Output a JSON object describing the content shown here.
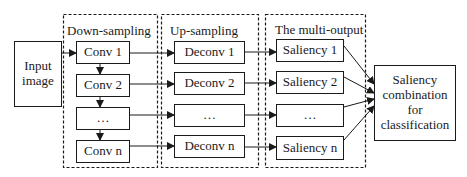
{
  "diagram": {
    "input": {
      "label_lines": [
        "Input",
        "image"
      ]
    },
    "groups": [
      {
        "id": "down",
        "title": "Down-sampling",
        "items": [
          "Conv 1",
          "Conv 2",
          "…",
          "Conv n"
        ]
      },
      {
        "id": "up",
        "title": "Up-sampling",
        "items": [
          "Deconv 1",
          "Deconv 2",
          "…",
          "Deconv n"
        ]
      },
      {
        "id": "multi",
        "title": "The multi-output",
        "items": [
          "Saliency 1",
          "Saliency 2",
          "…",
          "Saliency n"
        ]
      }
    ],
    "output": {
      "label_lines": [
        "Saliency",
        "combination",
        "for",
        "classification"
      ]
    },
    "colors": {
      "stroke": "#1a1a1a",
      "background": "#ffffff"
    }
  }
}
